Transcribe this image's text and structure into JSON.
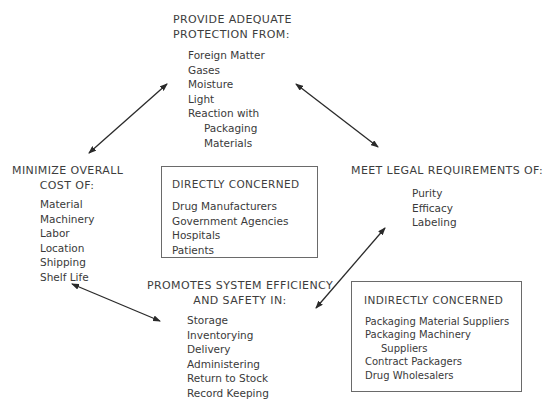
{
  "diagram": {
    "top": {
      "heading": [
        "PROVIDE ADEQUATE",
        "PROTECTION FROM:"
      ],
      "items": [
        "Foreign Matter",
        "Gases",
        "Moisture",
        "Light",
        "Reaction with"
      ],
      "sub_items": [
        "Packaging",
        "Materials"
      ]
    },
    "left": {
      "heading": [
        "MINIMIZE OVERALL",
        "COST OF:"
      ],
      "items": [
        "Material",
        "Machinery",
        "Labor",
        "Location",
        "Shipping",
        "Shelf Life"
      ]
    },
    "right": {
      "heading": "MEET LEGAL REQUIREMENTS OF:",
      "items": [
        "Purity",
        "Efficacy",
        "Labeling"
      ]
    },
    "bottom": {
      "heading": [
        "PROMOTES SYSTEM EFFICIENCY",
        "AND SAFETY IN:"
      ],
      "items": [
        "Storage",
        "Inventorying",
        "Delivery",
        "Administering",
        "Return to Stock",
        "Record Keeping"
      ]
    },
    "directly_concerned": {
      "title": "DIRECTLY CONCERNED",
      "items": [
        "Drug Manufacturers",
        "Government Agencies",
        "Hospitals",
        "Patients"
      ]
    },
    "indirectly_concerned": {
      "title": "INDIRECTLY CONCERNED",
      "items": [
        "Packaging Material Suppliers",
        "Packaging Machinery"
      ],
      "continued": "Suppliers",
      "items_after": [
        "Contract Packagers",
        "Drug Wholesalers"
      ]
    },
    "arrows": [
      {
        "name": "top-left",
        "from": [
          89,
          153
        ],
        "to": [
          167,
          84
        ]
      },
      {
        "name": "top-right",
        "from": [
          296,
          84
        ],
        "to": [
          378,
          147
        ]
      },
      {
        "name": "bottom-right",
        "from": [
          385,
          228
        ],
        "to": [
          316,
          308
        ]
      },
      {
        "name": "bottom-left",
        "from": [
          72,
          284
        ],
        "to": [
          160,
          321
        ]
      }
    ],
    "colors": {
      "text": "#3a3a3a",
      "line": "#2a2a2a",
      "box_border": "#6a6a6a",
      "background": "#ffffff"
    }
  }
}
